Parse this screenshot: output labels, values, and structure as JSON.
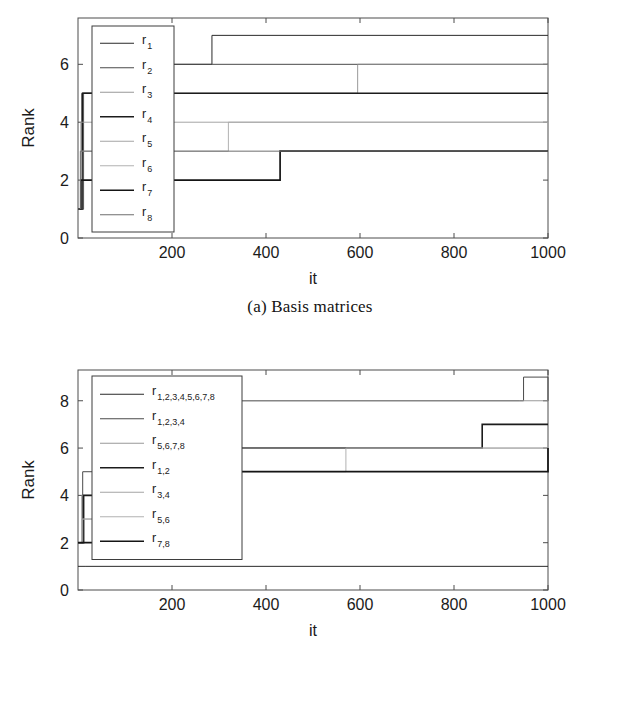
{
  "figure": {
    "panels": [
      {
        "id": "a",
        "caption": "(a) Basis matrices"
      },
      {
        "id": "b",
        "caption": "(b) Transfer matrices"
      }
    ]
  },
  "chart_data": [
    {
      "type": "line",
      "panel": "a",
      "title": "(a) Basis matrices",
      "xlabel": "it",
      "ylabel": "Rank",
      "xlim": [
        0,
        1000
      ],
      "ylim": [
        0,
        7.6
      ],
      "xticks": [
        200,
        400,
        600,
        800,
        1000
      ],
      "yticks": [
        0,
        2,
        4,
        6
      ],
      "grid": false,
      "legend_position": "upper-left-inside",
      "step_style": "post",
      "series": [
        {
          "name": "r_1",
          "label": "r",
          "sublabel": "1",
          "x": [
            0,
            10,
            175,
            285,
            1000
          ],
          "y": [
            1,
            5,
            6,
            7,
            7
          ]
        },
        {
          "name": "r_2",
          "label": "r",
          "sublabel": "2",
          "x": [
            0,
            8,
            175,
            1000
          ],
          "y": [
            1,
            5,
            6,
            6
          ]
        },
        {
          "name": "r_3",
          "label": "r",
          "sublabel": "3",
          "x": [
            0,
            12,
            320,
            595,
            1000
          ],
          "y": [
            1,
            5,
            5,
            6,
            6
          ]
        },
        {
          "name": "r_4",
          "label": "r",
          "sublabel": "4",
          "x": [
            0,
            10,
            1000
          ],
          "y": [
            1,
            5,
            5
          ]
        },
        {
          "name": "r_5",
          "label": "r",
          "sublabel": "5",
          "x": [
            0,
            6,
            1000
          ],
          "y": [
            1,
            4,
            4
          ]
        },
        {
          "name": "r_6",
          "label": "r",
          "sublabel": "6",
          "x": [
            0,
            8,
            320,
            1000
          ],
          "y": [
            1,
            3,
            4,
            4
          ]
        },
        {
          "name": "r_7",
          "label": "r",
          "sublabel": "7",
          "x": [
            0,
            6,
            430,
            1000
          ],
          "y": [
            1,
            2,
            3,
            3
          ]
        },
        {
          "name": "r_8",
          "label": "r",
          "sublabel": "8",
          "x": [
            0,
            5,
            1000
          ],
          "y": [
            1,
            3,
            3
          ]
        }
      ]
    },
    {
      "type": "line",
      "panel": "b",
      "title": "(b) Transfer matrices",
      "xlabel": "it",
      "ylabel": "Rank",
      "xlim": [
        0,
        1000
      ],
      "ylim": [
        0,
        9.3
      ],
      "xticks": [
        200,
        400,
        600,
        800,
        1000
      ],
      "yticks": [
        0,
        2,
        4,
        6,
        8
      ],
      "grid": false,
      "legend_position": "upper-left-inside",
      "step_style": "post",
      "series": [
        {
          "name": "r_1_2_3_4_5_6_7_8",
          "label": "r",
          "sublabel": "1,2,3,4,5,6,7,8",
          "x": [
            0,
            15,
            1000
          ],
          "y": [
            1,
            1,
            1
          ]
        },
        {
          "name": "r_1_2_3_4",
          "label": "r",
          "sublabel": "1,2,3,4",
          "x": [
            0,
            10,
            335,
            940,
            948,
            1000
          ],
          "y": [
            2,
            5,
            8,
            8,
            9,
            8
          ]
        },
        {
          "name": "r_5_6_7_8",
          "label": "r",
          "sublabel": "5,6,7,8",
          "x": [
            0,
            8,
            335,
            1000
          ],
          "y": [
            2,
            4,
            8,
            8
          ]
        },
        {
          "name": "r_1_2",
          "label": "r",
          "sublabel": "1,2",
          "x": [
            0,
            12,
            335,
            860,
            1000
          ],
          "y": [
            2,
            4,
            6,
            7,
            7
          ]
        },
        {
          "name": "r_3_4",
          "label": "r",
          "sublabel": "3,4",
          "x": [
            0,
            10,
            335,
            1000
          ],
          "y": [
            2,
            3,
            6,
            6
          ]
        },
        {
          "name": "r_5_6",
          "label": "r",
          "sublabel": "5,6",
          "x": [
            0,
            8,
            335,
            445,
            570,
            1000
          ],
          "y": [
            2,
            3,
            5,
            5,
            6,
            6
          ]
        },
        {
          "name": "r_7_8",
          "label": "r",
          "sublabel": "7,8",
          "x": [
            0,
            6,
            335,
            445,
            1000
          ],
          "y": [
            2,
            2,
            5,
            5,
            6
          ]
        }
      ]
    }
  ]
}
